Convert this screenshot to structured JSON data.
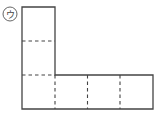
{
  "figure": {
    "label": "ウ",
    "colors": {
      "stroke": "#444444",
      "background": "#ffffff"
    },
    "grid": {
      "origin_x": 22,
      "origin_y": 7,
      "cell": 33,
      "columns": 4,
      "rows": 3
    }
  }
}
